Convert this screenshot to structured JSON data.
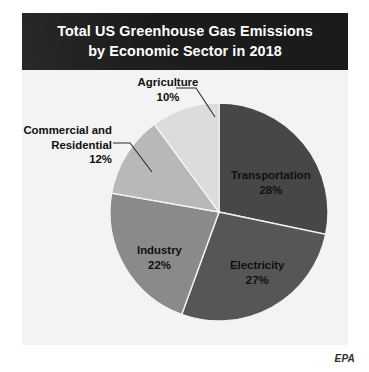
{
  "figure": {
    "title_line_1": "Total US Greenhouse Gas Emissions",
    "title_line_2": "by Economic Sector in 2018",
    "credit": "EPA",
    "banner_color": "#1b1b1b",
    "plate_color": "#f3f3f3",
    "page_color": "#ffffff"
  },
  "chart_data": {
    "type": "pie",
    "title": "Total US Greenhouse Gas Emissions by Economic Sector in 2018",
    "subtitle": "",
    "xlabel": "",
    "ylabel": "",
    "units": "percent of total emissions",
    "start_angle_deg": 0,
    "direction": "clockwise",
    "grid": false,
    "legend": "none (direct slice labels)",
    "total": 99,
    "categories": [
      "Transportation",
      "Electricity",
      "Industry",
      "Commercial and Residential",
      "Agriculture"
    ],
    "values": [
      28,
      27,
      22,
      12,
      10
    ],
    "colors": [
      "#474747",
      "#565656",
      "#8a8a8a",
      "#b8b8b8",
      "#dcdcdc"
    ],
    "slices": [
      {
        "name": "Transportation",
        "value": 28,
        "value_label": "28%",
        "color": "#474747",
        "label_placement": "inside"
      },
      {
        "name": "Electricity",
        "value": 27,
        "value_label": "27%",
        "color": "#565656",
        "label_placement": "inside"
      },
      {
        "name": "Industry",
        "value": 22,
        "value_label": "22%",
        "color": "#8a8a8a",
        "label_placement": "inside"
      },
      {
        "name": "Commercial and Residential",
        "value": 12,
        "value_label": "12%",
        "color": "#b8b8b8",
        "label_placement": "outside-left",
        "name_line_1": "Commercial and",
        "name_line_2": "Residential"
      },
      {
        "name": "Agriculture",
        "value": 10,
        "value_label": "10%",
        "color": "#dcdcdc",
        "label_placement": "outside-top"
      }
    ]
  }
}
